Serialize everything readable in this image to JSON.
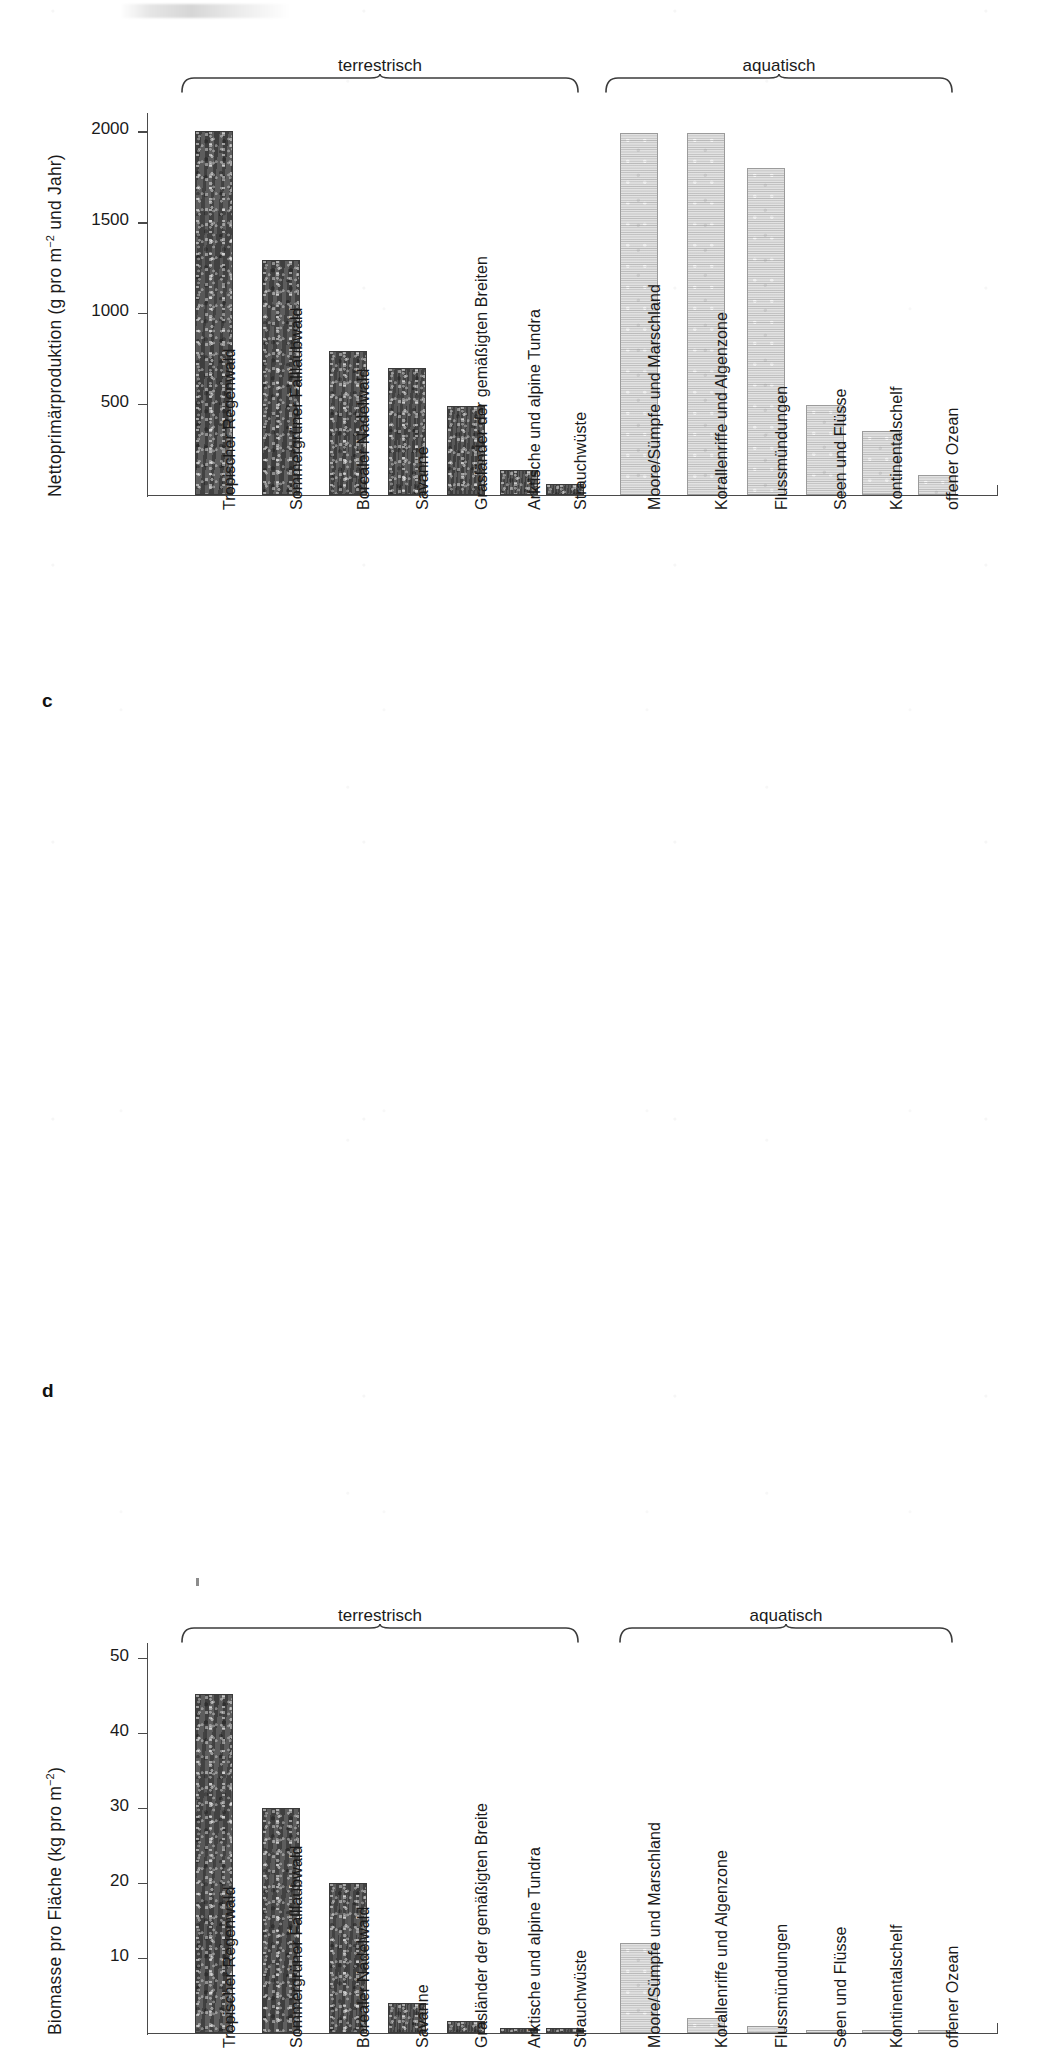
{
  "figure": {
    "panel_c_letter": "c",
    "panel_d_letter": "d",
    "group_labels": {
      "terrestrial": "terrestrisch",
      "aquatic": "aquatisch"
    },
    "colors": {
      "terrestrial_bar": "#4b4b4b",
      "aquatic_bar": "#e2e2e2",
      "axis": "#4a4a4a",
      "text": "#1a1a1a",
      "background": "#ffffff"
    }
  },
  "chart_data": [
    {
      "panel": "c",
      "type": "bar",
      "title": "",
      "xlabel": "",
      "ylabel": "Nettoprimärproduktion (g pro m-2 und Jahr)",
      "ylabel_html": "Nettoprimärproduktion (g pro m<sup>−2</sup> und Jahr)",
      "ylim": [
        0,
        2100
      ],
      "yticks": [
        500,
        1000,
        1500,
        2000
      ],
      "ytick_labels": [
        "500",
        "1000",
        "1500",
        "2000"
      ],
      "grid": false,
      "legend": "none",
      "groups": [
        {
          "name": "terrestrisch",
          "first": 0,
          "last": 6
        },
        {
          "name": "aquatisch",
          "first": 7,
          "last": 12
        }
      ],
      "categories": [
        "Tropischer Regenwald",
        "Sommergrüner Falllaubwald",
        "Borealer Nadelwald",
        "Savanne",
        "Grasländer der gemäßigten Breiten",
        "Arktische und alpine Tundra",
        "Strauchwüste",
        "Moore/Sümpfe und Marschland",
        "Korallenriffe und Algenzone",
        "Flussmündungen",
        "Seen und Flüsse",
        "Kontinentalschelf",
        "offener Ozean"
      ],
      "values": [
        2000,
        1290,
        790,
        700,
        490,
        140,
        60,
        1990,
        1990,
        1800,
        495,
        350,
        110
      ],
      "series_kinds": [
        "terrestrial",
        "terrestrial",
        "terrestrial",
        "terrestrial",
        "terrestrial",
        "terrestrial",
        "terrestrial",
        "aquatic",
        "aquatic",
        "aquatic",
        "aquatic",
        "aquatic",
        "aquatic"
      ]
    },
    {
      "panel": "d",
      "type": "bar",
      "title": "",
      "xlabel": "",
      "ylabel": "Biomasse pro Fläche (kg pro m-2)",
      "ylabel_html": "Biomasse pro Fläche (kg pro m<sup>−2</sup>)",
      "ylim": [
        0,
        52
      ],
      "yticks": [
        10,
        20,
        30,
        40,
        50
      ],
      "ytick_labels": [
        "10",
        "20",
        "30",
        "40",
        "50"
      ],
      "grid": false,
      "legend": "none",
      "groups": [
        {
          "name": "terrestrisch",
          "first": 0,
          "last": 6
        },
        {
          "name": "aquatisch",
          "first": 7,
          "last": 12
        }
      ],
      "categories": [
        "Tropischer Regenwald",
        "Sommergrüner Falllaubwald",
        "Borealer Nadelwald",
        "Savanne",
        "Grasländer der gemäßigten Breite",
        "Arktische und alpine Tundra",
        "Strauchwüste",
        "Moore/Sümpfe und Marschland",
        "Korallenriffe und Algenzone",
        "Flussmündungen",
        "Seen und Flüsse",
        "Kontinentalschelf",
        "offener Ozean"
      ],
      "values": [
        45.2,
        30.0,
        20.0,
        4.0,
        1.6,
        0.7,
        0.7,
        12.0,
        2.0,
        1.0,
        0.4,
        0.25,
        0.2
      ],
      "series_kinds": [
        "terrestrial",
        "terrestrial",
        "terrestrial",
        "terrestrial",
        "terrestrial",
        "terrestrial",
        "terrestrial",
        "aquatic",
        "aquatic",
        "aquatic",
        "aquatic",
        "aquatic",
        "aquatic"
      ]
    }
  ]
}
